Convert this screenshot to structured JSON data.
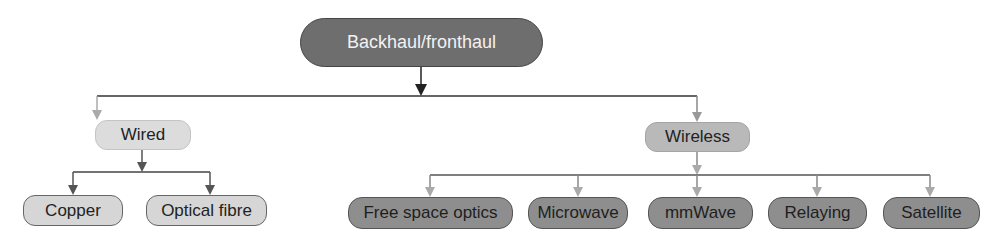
{
  "diagram": {
    "type": "tree",
    "root": {
      "label": "Backhaul/fronthaul",
      "color": "#6e6e6e"
    },
    "branches": [
      {
        "label": "Wired",
        "color": "#dcdcdc",
        "children": [
          {
            "label": "Copper"
          },
          {
            "label": "Optical fibre"
          }
        ]
      },
      {
        "label": "Wireless",
        "color": "#b9b9b9",
        "children": [
          {
            "label": "Free space optics"
          },
          {
            "label": "Microwave"
          },
          {
            "label": "mmWave"
          },
          {
            "label": "Relaying"
          },
          {
            "label": "Satellite"
          }
        ]
      }
    ],
    "colors": {
      "root_fill": "#6e6e6e",
      "wired_fill": "#dcdcdc",
      "wireless_fill": "#b9b9b9",
      "wired_leaf_fill": "#d6d6d6",
      "wireless_leaf_fill": "#8e8e8e",
      "line_dark": "#333333",
      "line_mid": "#666666",
      "arrow_light": "#aaaaaa"
    }
  }
}
